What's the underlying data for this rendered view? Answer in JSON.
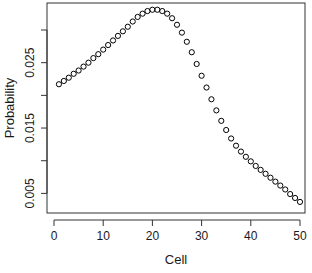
{
  "chart_data": {
    "type": "scatter",
    "title": "",
    "xlabel": "Cell",
    "ylabel": "Probability",
    "xlim": [
      0,
      51
    ],
    "ylim": [
      0.0025,
      0.0335
    ],
    "x_ticks": [
      0,
      10,
      20,
      30,
      40,
      50
    ],
    "x_tick_labels": [
      "0",
      "10",
      "20",
      "30",
      "40",
      "50"
    ],
    "y_ticks": [
      0.005,
      0.01,
      0.015,
      0.02,
      0.025,
      0.03
    ],
    "y_tick_labels": [
      "0.005",
      "",
      "0.015",
      "",
      "0.025",
      ""
    ],
    "grid": false,
    "legend": null,
    "marker": "open-circle",
    "color": "#000000",
    "x": [
      1,
      2,
      3,
      4,
      5,
      6,
      7,
      8,
      9,
      10,
      11,
      12,
      13,
      14,
      15,
      16,
      17,
      18,
      19,
      20,
      21,
      22,
      23,
      24,
      25,
      26,
      27,
      28,
      29,
      30,
      31,
      32,
      33,
      34,
      35,
      36,
      37,
      38,
      39,
      40,
      41,
      42,
      43,
      44,
      45,
      46,
      47,
      48,
      49,
      50
    ],
    "values": [
      0.0217,
      0.0222,
      0.0227,
      0.0233,
      0.0238,
      0.0244,
      0.025,
      0.0257,
      0.0263,
      0.027,
      0.0277,
      0.0284,
      0.0291,
      0.0298,
      0.0305,
      0.0313,
      0.032,
      0.0325,
      0.0329,
      0.0331,
      0.0331,
      0.0329,
      0.0325,
      0.0318,
      0.0308,
      0.0296,
      0.0282,
      0.0266,
      0.0248,
      0.023,
      0.0212,
      0.0194,
      0.0177,
      0.0161,
      0.0147,
      0.0134,
      0.0123,
      0.0114,
      0.0106,
      0.0099,
      0.0092,
      0.0086,
      0.008,
      0.0074,
      0.0068,
      0.0062,
      0.0056,
      0.0049,
      0.0043,
      0.0037
    ]
  }
}
